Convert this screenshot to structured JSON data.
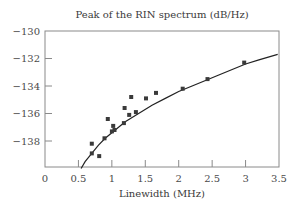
{
  "chart_data": {
    "type": "scatter",
    "title": "Peak of the RIN spectrum (dB/Hz)",
    "xlabel": "Linewidth (MHz)",
    "ylabel": "",
    "xlim": [
      0,
      3.5
    ],
    "ylim": [
      -140,
      -130
    ],
    "xticks": [
      0,
      0.5,
      1,
      1.5,
      2,
      2.5,
      3,
      3.5
    ],
    "xtick_labels": [
      "0",
      "0.5",
      "1",
      "1.5",
      "2",
      "2.5",
      "3",
      "3.5"
    ],
    "yticks": [
      -130,
      -132,
      -134,
      -136,
      -138
    ],
    "ytick_labels": [
      "−130",
      "−132",
      "−134",
      "−136",
      "−138"
    ],
    "grid": false,
    "legend": null,
    "series": [
      {
        "name": "Measured",
        "type": "scatter",
        "marker": "square",
        "x": [
          0.7,
          0.7,
          0.81,
          0.89,
          0.94,
          1.02,
          1.0,
          1.04,
          1.19,
          1.18,
          1.26,
          1.29,
          1.36,
          1.51,
          1.66,
          2.06,
          2.43,
          2.98
        ],
        "y": [
          -138.2,
          -138.9,
          -139.1,
          -137.8,
          -136.4,
          -136.9,
          -137.3,
          -137.2,
          -135.6,
          -136.7,
          -136.1,
          -134.8,
          -135.9,
          -134.9,
          -134.5,
          -134.2,
          -133.5,
          -132.3
        ]
      },
      {
        "name": "Fit",
        "type": "line",
        "x": [
          0.54,
          0.6,
          0.7,
          0.8,
          0.9,
          1.0,
          1.2,
          1.4,
          1.6,
          1.8,
          2.0,
          2.2,
          2.4,
          2.6,
          2.8,
          3.0,
          3.2,
          3.48
        ],
        "y": [
          -140.0,
          -139.5,
          -138.9,
          -138.3,
          -137.8,
          -137.4,
          -136.6,
          -136.0,
          -135.4,
          -134.9,
          -134.4,
          -134.0,
          -133.6,
          -133.2,
          -132.8,
          -132.4,
          -132.1,
          -131.7
        ]
      }
    ]
  },
  "colors": {
    "axis": "#8a8a8a",
    "marker": "#3a3a3a",
    "line": "#222222",
    "text": "#3a3a3a"
  }
}
